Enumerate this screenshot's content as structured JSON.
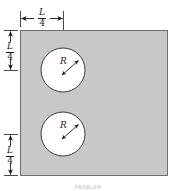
{
  "figure": {
    "caption": "PROBLEM",
    "colors": {
      "plate_fill": "#c8c8c8",
      "plate_stroke": "#6f6f6f",
      "hole_fill": "#ffffff",
      "hole_stroke": "#3a3a3a",
      "dimension_line": "#1a1a1a",
      "background": "#ffffff",
      "caption_text": "#b9b9b9"
    },
    "plate": {
      "name": "square-plate",
      "x": 20,
      "y": 30,
      "width": 148,
      "height": 146
    },
    "holes": [
      {
        "name": "upper-hole",
        "cx": 63,
        "cy": 70,
        "r": 22,
        "radius_label": "R"
      },
      {
        "name": "lower-hole",
        "cx": 63,
        "cy": 134,
        "r": 22,
        "radius_label": "R"
      }
    ],
    "dimensions": [
      {
        "name": "top-horizontal-dimension",
        "orientation": "horizontal",
        "numerator": "L",
        "denominator": "4",
        "from": 20,
        "to": 63,
        "axis_pos": 18
      },
      {
        "name": "left-upper-vertical-dimension",
        "orientation": "vertical",
        "numerator": "L",
        "denominator": "4",
        "from": 30,
        "to": 70,
        "axis_pos": 10
      },
      {
        "name": "left-lower-vertical-dimension",
        "orientation": "vertical",
        "numerator": "L",
        "denominator": "4",
        "from": 134,
        "to": 176,
        "axis_pos": 10
      }
    ]
  }
}
